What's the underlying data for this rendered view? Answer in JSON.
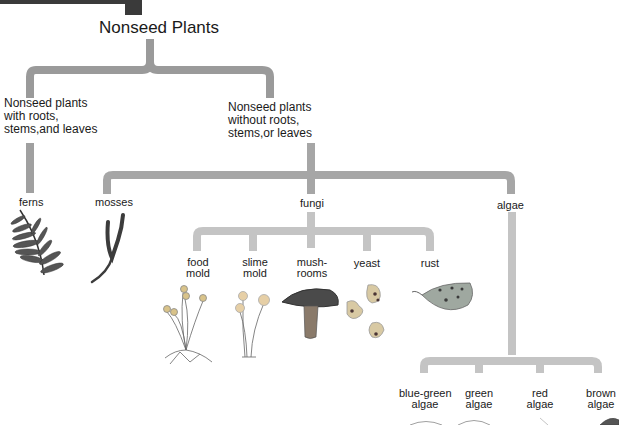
{
  "diagram": {
    "title": "Nonseed Plants",
    "colors": {
      "level1_connector": "#9a9a9a",
      "level2_connector": "#a8a8a8",
      "level3_connector": "#c4c4c4",
      "header_block": "#3a3a3a",
      "text": "#1a1a1a"
    },
    "branches": [
      {
        "label_line1": "Nonseed plants",
        "label_line2": "with roots,",
        "label_line3": "stems,and leaves",
        "children": [
          {
            "label": "ferns",
            "icon": "fern-icon"
          }
        ]
      },
      {
        "label_line1": "Nonseed plants",
        "label_line2": "without roots,",
        "label_line3": "stems,or leaves",
        "children": [
          {
            "label": "mosses",
            "icon": "moss-icon"
          },
          {
            "label": "fungi",
            "children": [
              {
                "line1": "food",
                "line2": "mold",
                "icon": "food-mold-icon"
              },
              {
                "line1": "slime",
                "line2": "mold",
                "icon": "slime-mold-icon"
              },
              {
                "line1": "mush-",
                "line2": "rooms",
                "icon": "mushroom-icon"
              },
              {
                "line1": "yeast",
                "line2": "",
                "icon": "yeast-icon"
              },
              {
                "line1": "rust",
                "line2": "",
                "icon": "rust-leaf-icon"
              }
            ]
          },
          {
            "label": "algae",
            "children": [
              {
                "line1": "blue-green",
                "line2": "algae",
                "icon": "blue-green-algae-icon"
              },
              {
                "line1": "green",
                "line2": "algae",
                "icon": "green-algae-icon"
              },
              {
                "line1": "red",
                "line2": "algae",
                "icon": "red-algae-icon"
              },
              {
                "line1": "brown",
                "line2": "algae",
                "icon": "brown-algae-icon"
              }
            ]
          }
        ]
      }
    ]
  }
}
